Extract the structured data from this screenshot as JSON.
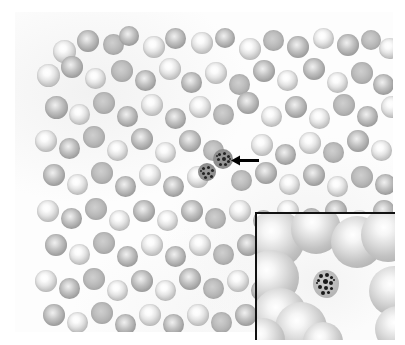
{
  "figure": {
    "kind": "light-microscopy-photomicrograph",
    "caption": "",
    "colors": {
      "background": "#ffffff",
      "field_background": "#fdfdfd",
      "rbc_body": "#a9a9a9",
      "rbc_pallor": "#ffffff",
      "parasite_chromatin": "#242424",
      "arrow": "#000000",
      "inset_border": "#111111"
    }
  },
  "main_field": {
    "name": "blood-smear-field",
    "x": 15,
    "y": 12,
    "width": 378,
    "height": 320,
    "rbc_count": 118,
    "rbcs": [
      [
        38,
        28,
        23,
        "pale"
      ],
      [
        62,
        18,
        22,
        "dark"
      ],
      [
        88,
        22,
        21,
        "flat"
      ],
      [
        104,
        14,
        20,
        "dark"
      ],
      [
        128,
        24,
        22,
        "pale"
      ],
      [
        150,
        16,
        21,
        "dark"
      ],
      [
        176,
        20,
        22,
        "pale"
      ],
      [
        200,
        16,
        20,
        "dark"
      ],
      [
        224,
        26,
        22,
        "pale"
      ],
      [
        248,
        18,
        21,
        "flat"
      ],
      [
        272,
        24,
        22,
        "dark"
      ],
      [
        298,
        16,
        21,
        "pale"
      ],
      [
        322,
        22,
        22,
        "dark"
      ],
      [
        346,
        18,
        20,
        "flat"
      ],
      [
        364,
        26,
        21,
        "pale"
      ],
      [
        380,
        16,
        19,
        "dark"
      ],
      [
        22,
        52,
        23,
        "pale"
      ],
      [
        46,
        44,
        22,
        "dark"
      ],
      [
        70,
        56,
        21,
        "pale"
      ],
      [
        96,
        48,
        22,
        "flat"
      ],
      [
        120,
        58,
        21,
        "dark"
      ],
      [
        144,
        46,
        22,
        "pale"
      ],
      [
        166,
        60,
        21,
        "dark"
      ],
      [
        190,
        50,
        22,
        "pale"
      ],
      [
        214,
        62,
        21,
        "flat"
      ],
      [
        238,
        48,
        22,
        "dark"
      ],
      [
        262,
        58,
        21,
        "pale"
      ],
      [
        288,
        46,
        22,
        "dark"
      ],
      [
        312,
        60,
        21,
        "pale"
      ],
      [
        336,
        50,
        22,
        "flat"
      ],
      [
        358,
        62,
        21,
        "dark"
      ],
      [
        380,
        48,
        20,
        "pale"
      ],
      [
        30,
        84,
        23,
        "dark"
      ],
      [
        54,
        92,
        21,
        "pale"
      ],
      [
        78,
        80,
        22,
        "flat"
      ],
      [
        102,
        94,
        21,
        "dark"
      ],
      [
        126,
        82,
        22,
        "pale"
      ],
      [
        150,
        96,
        21,
        "dark"
      ],
      [
        174,
        84,
        22,
        "pale"
      ],
      [
        198,
        92,
        21,
        "flat"
      ],
      [
        222,
        80,
        22,
        "dark"
      ],
      [
        246,
        94,
        21,
        "pale"
      ],
      [
        270,
        84,
        22,
        "dark"
      ],
      [
        294,
        96,
        21,
        "pale"
      ],
      [
        318,
        82,
        22,
        "flat"
      ],
      [
        342,
        94,
        21,
        "dark"
      ],
      [
        366,
        84,
        22,
        "pale"
      ],
      [
        384,
        96,
        19,
        "dark"
      ],
      [
        20,
        118,
        22,
        "pale"
      ],
      [
        44,
        126,
        21,
        "dark"
      ],
      [
        68,
        114,
        22,
        "flat"
      ],
      [
        92,
        128,
        21,
        "pale"
      ],
      [
        116,
        116,
        22,
        "dark"
      ],
      [
        140,
        130,
        21,
        "pale"
      ],
      [
        164,
        118,
        22,
        "dark"
      ],
      [
        188,
        128,
        21,
        "flat"
      ],
      [
        236,
        122,
        22,
        "pale"
      ],
      [
        260,
        132,
        21,
        "dark"
      ],
      [
        284,
        120,
        22,
        "pale"
      ],
      [
        308,
        130,
        21,
        "flat"
      ],
      [
        332,
        118,
        22,
        "dark"
      ],
      [
        356,
        128,
        21,
        "pale"
      ],
      [
        380,
        120,
        20,
        "dark"
      ],
      [
        28,
        152,
        22,
        "dark"
      ],
      [
        52,
        162,
        21,
        "pale"
      ],
      [
        76,
        150,
        22,
        "flat"
      ],
      [
        100,
        164,
        21,
        "dark"
      ],
      [
        124,
        152,
        22,
        "pale"
      ],
      [
        148,
        164,
        21,
        "dark"
      ],
      [
        172,
        154,
        22,
        "pale"
      ],
      [
        216,
        158,
        21,
        "flat"
      ],
      [
        240,
        150,
        22,
        "dark"
      ],
      [
        264,
        162,
        21,
        "pale"
      ],
      [
        288,
        152,
        22,
        "dark"
      ],
      [
        312,
        164,
        21,
        "pale"
      ],
      [
        336,
        154,
        22,
        "flat"
      ],
      [
        360,
        162,
        21,
        "dark"
      ],
      [
        382,
        152,
        19,
        "pale"
      ],
      [
        22,
        188,
        22,
        "pale"
      ],
      [
        46,
        196,
        21,
        "dark"
      ],
      [
        70,
        186,
        22,
        "flat"
      ],
      [
        94,
        198,
        21,
        "pale"
      ],
      [
        118,
        188,
        22,
        "dark"
      ],
      [
        142,
        198,
        21,
        "pale"
      ],
      [
        166,
        188,
        22,
        "dark"
      ],
      [
        190,
        196,
        21,
        "flat"
      ],
      [
        214,
        188,
        22,
        "pale"
      ],
      [
        238,
        198,
        21,
        "dark"
      ],
      [
        262,
        188,
        22,
        "pale"
      ],
      [
        286,
        196,
        21,
        "flat"
      ],
      [
        310,
        188,
        22,
        "dark"
      ],
      [
        334,
        198,
        21,
        "pale"
      ],
      [
        358,
        188,
        22,
        "dark"
      ],
      [
        380,
        196,
        19,
        "pale"
      ],
      [
        30,
        222,
        22,
        "dark"
      ],
      [
        54,
        232,
        21,
        "pale"
      ],
      [
        78,
        220,
        22,
        "flat"
      ],
      [
        102,
        234,
        21,
        "dark"
      ],
      [
        126,
        222,
        22,
        "pale"
      ],
      [
        150,
        234,
        21,
        "dark"
      ],
      [
        174,
        222,
        22,
        "pale"
      ],
      [
        198,
        232,
        21,
        "flat"
      ],
      [
        222,
        222,
        22,
        "dark"
      ],
      [
        246,
        232,
        21,
        "pale"
      ],
      [
        20,
        258,
        22,
        "pale"
      ],
      [
        44,
        266,
        21,
        "dark"
      ],
      [
        68,
        256,
        22,
        "flat"
      ],
      [
        92,
        268,
        21,
        "pale"
      ],
      [
        116,
        258,
        22,
        "dark"
      ],
      [
        140,
        268,
        21,
        "pale"
      ],
      [
        164,
        256,
        22,
        "dark"
      ],
      [
        188,
        266,
        21,
        "flat"
      ],
      [
        212,
        258,
        22,
        "pale"
      ],
      [
        236,
        268,
        21,
        "dark"
      ],
      [
        28,
        292,
        22,
        "dark"
      ],
      [
        52,
        300,
        21,
        "pale"
      ],
      [
        76,
        290,
        22,
        "flat"
      ],
      [
        100,
        302,
        21,
        "dark"
      ],
      [
        124,
        292,
        22,
        "pale"
      ],
      [
        148,
        302,
        21,
        "dark"
      ],
      [
        172,
        292,
        22,
        "pale"
      ],
      [
        196,
        300,
        21,
        "flat"
      ],
      [
        220,
        292,
        22,
        "dark"
      ],
      [
        244,
        300,
        20,
        "pale"
      ]
    ],
    "stippled_cells": [
      {
        "name": "parasitized-rbc-arrowed",
        "x": 198,
        "y": 137,
        "size": 20,
        "granules": [
          [
            5,
            4,
            3
          ],
          [
            10,
            3,
            3
          ],
          [
            14,
            6,
            3
          ],
          [
            4,
            9,
            3
          ],
          [
            9,
            8,
            4
          ],
          [
            14,
            11,
            3
          ],
          [
            6,
            14,
            3
          ],
          [
            11,
            14,
            3
          ],
          [
            3,
            6,
            2
          ],
          [
            16,
            9,
            2
          ]
        ]
      },
      {
        "name": "parasitized-rbc-second",
        "x": 183,
        "y": 151,
        "size": 18,
        "granules": [
          [
            4,
            4,
            3
          ],
          [
            9,
            3,
            3
          ],
          [
            13,
            6,
            3
          ],
          [
            4,
            9,
            3
          ],
          [
            9,
            9,
            3
          ],
          [
            12,
            12,
            3
          ],
          [
            6,
            13,
            3
          ],
          [
            2,
            7,
            2
          ]
        ]
      }
    ]
  },
  "arrow": {
    "name": "pointer-arrow",
    "direction": "left",
    "x": 216,
    "y": 142,
    "length": 28,
    "color": "#000000",
    "points_at": "parasitized-rbc-arrowed"
  },
  "inset": {
    "name": "magnified-inset",
    "x": 255,
    "y": 212,
    "width": 140,
    "height": 128,
    "border_sides": "top-left",
    "border_color": "#111111",
    "rbcs": [
      [
        -10,
        -4,
        58
      ],
      [
        34,
        -10,
        50
      ],
      [
        74,
        2,
        52
      ],
      [
        104,
        -6,
        54
      ],
      [
        -14,
        36,
        56
      ],
      [
        -4,
        74,
        54
      ],
      [
        18,
        88,
        52
      ],
      [
        112,
        52,
        50
      ],
      [
        118,
        92,
        46
      ],
      [
        -16,
        104,
        44
      ],
      [
        46,
        108,
        40
      ]
    ],
    "parasite": {
      "name": "magnified-parasitized-rbc",
      "x": 56,
      "y": 56,
      "width": 26,
      "height": 28,
      "granules": [
        [
          6,
          4,
          4
        ],
        [
          12,
          3,
          4
        ],
        [
          17,
          6,
          3
        ],
        [
          4,
          9,
          3
        ],
        [
          10,
          9,
          5
        ],
        [
          16,
          11,
          4
        ],
        [
          5,
          15,
          4
        ],
        [
          11,
          16,
          4
        ],
        [
          17,
          17,
          3
        ],
        [
          8,
          21,
          4
        ],
        [
          14,
          21,
          3
        ],
        [
          3,
          12,
          2
        ],
        [
          20,
          9,
          2
        ]
      ]
    }
  }
}
